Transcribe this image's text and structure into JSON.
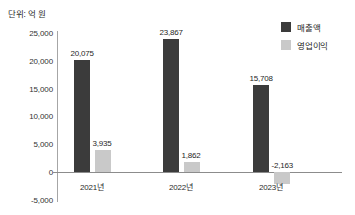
{
  "caption": "단위: 억 원",
  "legend": {
    "position": "top-right",
    "items": [
      {
        "label": "매출액",
        "color": "#3b3b3b",
        "key": "revenue"
      },
      {
        "label": "영업이익",
        "color": "#c9c9c9",
        "key": "profit"
      }
    ]
  },
  "axis": {
    "y_ticks": [
      "25,000",
      "20,000",
      "15,000",
      "10,000",
      "5,000",
      "0",
      "-5,000"
    ],
    "y_tick_values": [
      25000,
      20000,
      15000,
      10000,
      5000,
      0,
      -5000
    ]
  },
  "bar_labels": {
    "revenue": [
      "20,075",
      "23,867",
      "15,708"
    ],
    "profit": [
      "3,935",
      "1,862",
      "-2,163"
    ]
  },
  "chart_data": {
    "type": "bar",
    "title": "",
    "subtitle": "",
    "xlabel": "",
    "ylabel": "단위: 억 원",
    "categories": [
      "2021년",
      "2022년",
      "2023년"
    ],
    "series": [
      {
        "name": "매출액",
        "color": "#3b3b3b",
        "values": [
          20075,
          23867,
          15708
        ]
      },
      {
        "name": "영업이익",
        "color": "#c9c9c9",
        "values": [
          3935,
          1862,
          -2163
        ]
      }
    ],
    "ylim": [
      -5000,
      25000
    ],
    "ytick_step": 5000,
    "grid": false,
    "legend_position": "top-right",
    "value_labels": true
  }
}
